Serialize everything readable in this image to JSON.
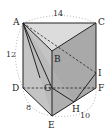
{
  "figure": {
    "type": "triangular-prism-solid",
    "vertices": {
      "A": {
        "label": "A",
        "x": 23,
        "y": 23
      },
      "B": {
        "label": "B",
        "x": 52,
        "y": 51
      },
      "C": {
        "label": "C",
        "x": 96,
        "y": 23
      },
      "D": {
        "label": "D",
        "x": 23,
        "y": 88
      },
      "E": {
        "label": "E",
        "x": 52,
        "y": 116
      },
      "F": {
        "label": "F",
        "x": 96,
        "y": 88
      },
      "G": {
        "label": "G",
        "x": 52,
        "y": 88
      },
      "H": {
        "label": "H",
        "x": 74,
        "y": 102
      },
      "I": {
        "label": "I",
        "x": 96,
        "y": 73
      }
    },
    "dimensions": {
      "AC": "14",
      "AD": "12",
      "DE": "8",
      "EF": "10"
    },
    "colors": {
      "top_face": "#dcdcdc",
      "left_face": "#c4c4c4",
      "right_face": "#a9a9a9",
      "front_face": "#b8b8b8",
      "edge": "#222222",
      "dotted_arc": "#999999"
    }
  }
}
